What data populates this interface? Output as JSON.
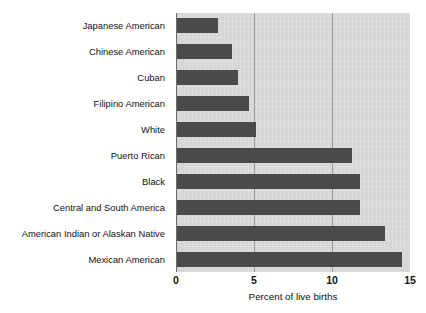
{
  "chart_data": {
    "type": "bar",
    "orientation": "horizontal",
    "title": "",
    "subtitle": "",
    "xlabel": "Percent of live births",
    "ylabel": "",
    "xlim": [
      0,
      15
    ],
    "xticks": [
      0,
      5,
      10,
      15
    ],
    "xtick_labels": [
      "0",
      "5",
      "10",
      "15"
    ],
    "grid": true,
    "grid_axis": "x",
    "legend": false,
    "legend_position": "none",
    "categories": [
      "Japanese American",
      "Chinese American",
      "Cuban",
      "Filipino American",
      "White",
      "Puerto Rican",
      "Black",
      "Central and South America",
      "American Indian or Alaskan Native",
      "Mexican American"
    ],
    "values": [
      2.7,
      3.6,
      4.0,
      4.7,
      5.1,
      11.3,
      11.8,
      11.8,
      13.4,
      14.5
    ],
    "bar_color": "#4a4a4a",
    "plot_background": "#d6d6d6",
    "page_background": "#ffffff",
    "axis_color": "#6b6b6b",
    "gridline_color": "#9a9a9a"
  }
}
